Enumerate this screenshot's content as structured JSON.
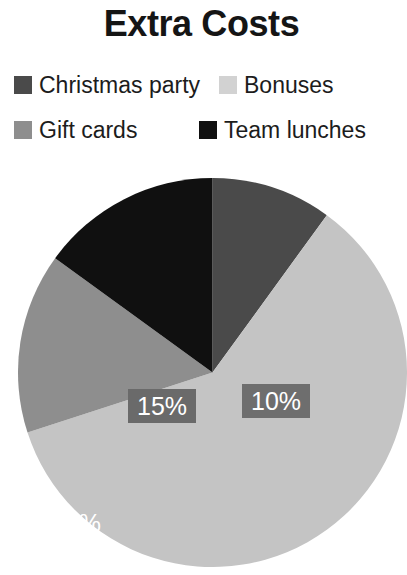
{
  "chart": {
    "title": "Extra Costs"
  },
  "legend": {
    "items": [
      {
        "label": "Christmas party",
        "color": "#4a4a4a",
        "swatch_name": "legend-swatch-christmas-party"
      },
      {
        "label": "Bonuses",
        "color": "#d2d2d2",
        "swatch_name": "legend-swatch-bonuses"
      },
      {
        "label": "Gift cards",
        "color": "#8e8e8e",
        "swatch_name": "legend-swatch-gift-cards"
      },
      {
        "label": "Team lunches",
        "color": "#101010",
        "swatch_name": "legend-swatch-team-lunches"
      }
    ]
  },
  "labels": {
    "christmas": "10%",
    "bonuses": "60%",
    "gift": "15%",
    "team": "15%"
  },
  "chart_data": {
    "type": "pie",
    "title": "Extra Costs",
    "xlabel": "",
    "ylabel": "",
    "legend_position": "top",
    "grid": false,
    "value_unit": "percent",
    "start_angle_deg": 0,
    "direction": "clockwise",
    "categories": [
      "Christmas party",
      "Bonuses",
      "Gift cards",
      "Team lunches"
    ],
    "values": [
      10,
      60,
      15,
      15
    ],
    "data_labels": [
      "10%",
      "60%",
      "15%",
      "15%"
    ],
    "colors": [
      "#4a4a4a",
      "#c4c4c4",
      "#8e8e8e",
      "#101010"
    ],
    "slices": [
      {
        "name": "Christmas party",
        "value": 10,
        "label": "10%",
        "color": "#4a4a4a",
        "start_angle_deg": 0,
        "end_angle_deg": 36,
        "label_has_box": true,
        "label_box_color": "#6e6e6e",
        "label_text_color": "#ffffff"
      },
      {
        "name": "Bonuses",
        "value": 60,
        "label": "60%",
        "color": "#c4c4c4",
        "start_angle_deg": 36,
        "end_angle_deg": 252,
        "label_has_box": false,
        "label_text_color": "#ffffff"
      },
      {
        "name": "Gift cards",
        "value": 15,
        "label": "15%",
        "color": "#8e8e8e",
        "start_angle_deg": 252,
        "end_angle_deg": 306,
        "label_has_box": false,
        "label_text_color": "#ffffff"
      },
      {
        "name": "Team lunches",
        "value": 15,
        "label": "15%",
        "color": "#101010",
        "start_angle_deg": 306,
        "end_angle_deg": 360,
        "label_has_box": true,
        "label_box_color": "#6a6a6a",
        "label_text_color": "#ffffff"
      }
    ],
    "total": 100
  }
}
